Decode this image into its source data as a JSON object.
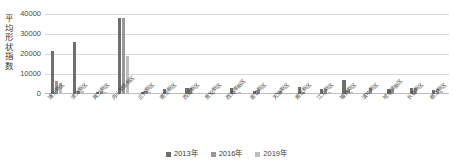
{
  "chart_data": {
    "type": "bar",
    "title": "",
    "xlabel": "",
    "ylabel": "平均形状指数",
    "ylim": [
      0,
      40000
    ],
    "yticks": [
      0,
      10000,
      20000,
      30000,
      40000
    ],
    "grid": true,
    "legend_position": "bottom",
    "categories": [
      "浦东新区",
      "滨海新区",
      "两江新区",
      "舟山群岛新区",
      "兰州新区",
      "南沙新区",
      "西咸新区",
      "贵安新区",
      "西海岸新区",
      "金普新区",
      "天府新区",
      "湘江新区",
      "江北新区",
      "福州新区",
      "滇中新区",
      "哈尔滨新区",
      "长春新区",
      "赣江新区"
    ],
    "series": [
      {
        "name": "2013年",
        "color": "#6e6e6e",
        "values": [
          21500,
          25800,
          1200,
          37800,
          1000,
          2600,
          3200,
          300,
          2800,
          1400,
          400,
          3600,
          2300,
          7200,
          400,
          2700,
          3200,
          2200
        ]
      },
      {
        "name": "2016年",
        "color": "#989898",
        "values": [
          6500,
          1300,
          1600,
          37800,
          1400,
          300,
          3000,
          200,
          500,
          2000,
          1500,
          900,
          2400,
          1900,
          2900,
          2700,
          3200,
          2400
        ]
      },
      {
        "name": "2019年",
        "color": "#bdbdbd",
        "values": [
          5400,
          1700,
          900,
          18800,
          1200,
          200,
          700,
          200,
          1200,
          600,
          500,
          400,
          900,
          1200,
          300,
          200,
          300,
          1600
        ]
      }
    ]
  },
  "legend": {
    "items": [
      {
        "label": "2013年",
        "color": "#6e6e6e"
      },
      {
        "label": "2016年",
        "color": "#989898"
      },
      {
        "label": "2019年",
        "color": "#bdbdbd"
      }
    ]
  }
}
